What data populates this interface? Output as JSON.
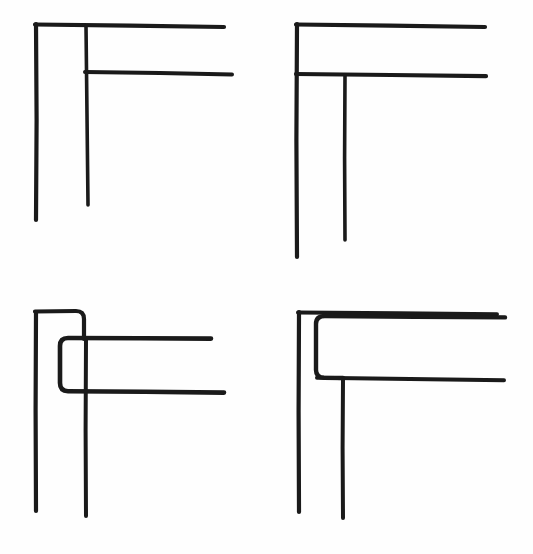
{
  "document": {
    "title": "Corner Joint Detail Sketches",
    "background_color": "#fefefe",
    "ink_color": "#1a1a1a",
    "width": 533,
    "height": 554,
    "style": "hand-drawn line diagram",
    "figure_count": 4
  },
  "chart_data": {
    "type": "diagram",
    "subtitle": "",
    "xlabel": "",
    "ylabel": "",
    "grid": false,
    "legend": [],
    "annotations": [],
    "figures": [
      {
        "id": "figure-top-left",
        "position": "top-left",
        "description": "Plain L corner with outer wall line and an inner leaf returning to a second horizontal",
        "corner_style": "square",
        "strokes": [
          {
            "name": "outer-vertical",
            "type": "line",
            "x1": 36,
            "y1": 24,
            "x2": 36,
            "y2": 220
          },
          {
            "name": "outer-horizontal",
            "type": "line",
            "x1": 36,
            "y1": 24,
            "x2": 224,
            "y2": 27
          },
          {
            "name": "inner-vertical",
            "type": "line",
            "x1": 86,
            "y1": 26,
            "x2": 88,
            "y2": 205
          },
          {
            "name": "inner-horizontal",
            "type": "line",
            "x1": 86,
            "y1": 72,
            "x2": 232,
            "y2": 74
          }
        ]
      },
      {
        "id": "figure-top-right",
        "position": "top-right",
        "description": "L corner with outer wall continuing down and an inner leaf dropping from the second horizontal",
        "corner_style": "square",
        "strokes": [
          {
            "name": "outer-vertical",
            "type": "line",
            "x1": 297,
            "y1": 24,
            "x2": 297,
            "y2": 257
          },
          {
            "name": "outer-horizontal",
            "type": "line",
            "x1": 297,
            "y1": 24,
            "x2": 485,
            "y2": 27
          },
          {
            "name": "inner-horizontal",
            "type": "line",
            "x1": 297,
            "y1": 74,
            "x2": 486,
            "y2": 76
          },
          {
            "name": "inner-vertical",
            "type": "line",
            "x1": 345,
            "y1": 74,
            "x2": 345,
            "y2": 240
          }
        ]
      },
      {
        "id": "figure-bottom-left",
        "position": "bottom-left",
        "description": "Corner with rounded returns: outer leg hooks right and down, inner member forms an open rounded channel",
        "corner_style": "rounded",
        "strokes": [
          {
            "name": "outer-vertical",
            "type": "line",
            "x1": 36,
            "y1": 312,
            "x2": 36,
            "y2": 511
          },
          {
            "name": "outer-return-hook",
            "type": "path",
            "d": "M36,312 L78,311 Q84,311 84,318 L84,338"
          },
          {
            "name": "channel-upper",
            "type": "path",
            "d": "M211,339 L66,338 Q60,338 60,345 L60,384 Q60,391 66,391 L224,392"
          },
          {
            "name": "inner-vertical",
            "type": "line",
            "x1": 86,
            "y1": 339,
            "x2": 86,
            "y2": 516
          }
        ]
      },
      {
        "id": "figure-bottom-right",
        "position": "bottom-right",
        "description": "Corner with outer square leg and an inner rounded leaf turning down into the second horizontal",
        "corner_style": "rounded-inner",
        "strokes": [
          {
            "name": "outer-vertical",
            "type": "line",
            "x1": 299,
            "y1": 312,
            "x2": 299,
            "y2": 512
          },
          {
            "name": "outer-horizontal",
            "type": "line",
            "x1": 299,
            "y1": 312,
            "x2": 497,
            "y2": 314
          },
          {
            "name": "inner-rounded-leaf",
            "type": "path",
            "d": "M505,317 L323,316 Q316,316 316,323 L316,376 L343,378"
          },
          {
            "name": "inner-horizontal",
            "type": "line",
            "x1": 316,
            "y1": 378,
            "x2": 504,
            "y2": 380
          },
          {
            "name": "inner-vertical",
            "type": "line",
            "x1": 343,
            "y1": 378,
            "x2": 343,
            "y2": 518
          }
        ]
      }
    ]
  }
}
